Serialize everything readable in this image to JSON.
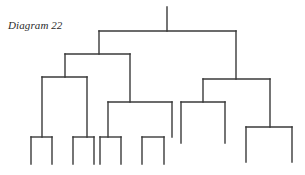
{
  "diagram": {
    "caption": "Diagram 22",
    "type": "dendrogram",
    "line_color": "#3a3a3a",
    "root": {
      "stem": {
        "x": 167,
        "y1": 7,
        "y2": 31
      },
      "bar": {
        "y": 31,
        "x1": 99,
        "x2": 236
      },
      "children": [
        {
          "x": 99,
          "bar": {
            "y": 54,
            "x1": 65,
            "x2": 130
          },
          "children": [
            {
              "x": 65,
              "bar": {
                "y": 77,
                "x1": 42,
                "x2": 87
              },
              "children": [
                {
                  "x": 42,
                  "bar": {
                    "y": 137,
                    "x1": 31,
                    "x2": 52
                  },
                  "leaves_to": 164
                },
                {
                  "x": 87,
                  "bar": {
                    "y": 137,
                    "x1": 73,
                    "x2": 94
                  },
                  "leaves_to": 164
                }
              ]
            },
            {
              "x": 130,
              "bar": {
                "y": 102,
                "x1": 108,
                "x2": 172
              },
              "children": [
                {
                  "x": 108,
                  "bar": {
                    "y": 137,
                    "x1": 100,
                    "x2": 121
                  },
                  "leaves_to": 164
                },
                {
                  "x": 172,
                  "bar": {
                    "y": 137,
                    "x1": 142,
                    "x2": 164
                  },
                  "leaves_to": 164
                }
              ]
            }
          ]
        },
        {
          "x": 236,
          "bar": {
            "y": 79,
            "x1": 203,
            "x2": 270
          },
          "children": [
            {
              "x": 203,
              "bar": {
                "y": 102,
                "x1": 181,
                "x2": 225
              },
              "leaves_to": 143
            },
            {
              "x": 270,
              "bar": {
                "y": 127,
                "x1": 246,
                "x2": 292
              },
              "leaves_to": 162
            }
          ]
        }
      ]
    },
    "leaf_count": 12
  }
}
